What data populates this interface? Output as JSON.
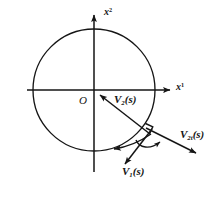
{
  "figure": {
    "type": "vector-diagram",
    "background_color": "#ffffff",
    "stroke_color": "#151515"
  },
  "axes": {
    "x_label": "x",
    "x_superscript": "1",
    "y_label": "x",
    "y_superscript": "2",
    "origin_label": "O"
  },
  "circle": {
    "center_x": 94,
    "center_y": 90,
    "radius": 61
  },
  "vectors": [
    {
      "id": "v2",
      "base": "V",
      "subscript": "2",
      "argument": "(s)",
      "label": "V2(s)",
      "from_x": 148,
      "from_y": 133,
      "to_x": 98,
      "to_y": 94,
      "arrow_at": "head"
    },
    {
      "id": "v1",
      "base": "V",
      "subscript": "1",
      "argument": "(s)",
      "label": "V1(s)",
      "from_x": 150,
      "from_y": 130,
      "to_x": 124,
      "to_y": 163,
      "arrow_at": "head"
    },
    {
      "id": "v2t",
      "base": "V",
      "subscript": "2t",
      "argument": "(s)",
      "label": "V2t(s)",
      "from_x": 148,
      "from_y": 131,
      "to_x": 196,
      "to_y": 153,
      "arrow_at": "head"
    },
    {
      "id": "tangent",
      "base": "",
      "subscript": "",
      "argument": "",
      "label": "tangent-arrow",
      "from_x": 150,
      "from_y": 133,
      "to_x": 112,
      "to_y": 148,
      "arrow_at": "head"
    }
  ],
  "markers": {
    "right_angle": "square-corner",
    "angle_arc": "curved-arc-with-arrowhead"
  }
}
